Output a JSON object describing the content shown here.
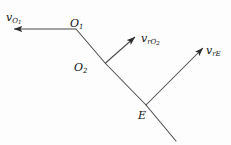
{
  "figure": {
    "type": "vector-diagram",
    "background_color": "#fdfdfd",
    "stroke_color": "#3a3a3a",
    "text_color": "#111111",
    "width": 231,
    "height": 145,
    "points": [
      {
        "id": "O1",
        "label_base": "O",
        "label_sub": "1",
        "x": 76,
        "y": 29
      },
      {
        "id": "O2",
        "label_base": "O",
        "label_sub": "2",
        "x": 105,
        "y": 63
      },
      {
        "id": "E",
        "label_base": "E",
        "label_sub": "",
        "x": 146,
        "y": 105
      }
    ],
    "segments": [
      {
        "id": "seg-o1-o2",
        "x1": 76,
        "y1": 29,
        "x2": 105,
        "y2": 63
      },
      {
        "id": "seg-o2-e",
        "x1": 105,
        "y1": 63,
        "x2": 146,
        "y2": 105
      },
      {
        "id": "seg-e-tail",
        "x1": 146,
        "y1": 105,
        "x2": 176,
        "y2": 141
      }
    ],
    "vectors": [
      {
        "id": "v-O1",
        "label_base": "v",
        "label_sub": "O",
        "label_subsub": "1",
        "from_x": 76,
        "from_y": 29,
        "to_x": 11,
        "to_y": 29
      },
      {
        "id": "v-rO2",
        "label_base": "v",
        "label_sub": "rO",
        "label_subsub": "2",
        "from_x": 105,
        "from_y": 63,
        "to_x": 134,
        "to_y": 36
      },
      {
        "id": "v-rE",
        "label_base": "v",
        "label_sub": "rE",
        "label_subsub": "",
        "from_x": 146,
        "from_y": 105,
        "to_x": 203,
        "to_y": 47
      }
    ]
  }
}
